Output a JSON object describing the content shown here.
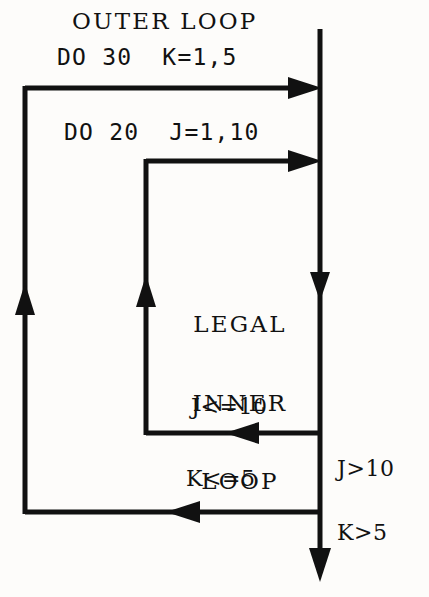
{
  "figure": {
    "kind": "flowchart",
    "background_color": "#fdfcfa",
    "ink_color": "#111111",
    "width": 429,
    "height": 597
  },
  "labels": {
    "outer_loop_caption": "OUTER LOOP",
    "outer_loop_statement": "DO 30  K=1,5",
    "inner_loop_statement": "DO 20  J=1,10",
    "inner_body_line1": "LEGAL",
    "inner_body_line2": "INNER",
    "inner_body_line3": "LOOP",
    "inner_continue_condition": "J<=10",
    "outer_continue_condition": "K<=5",
    "inner_exit_condition": "J>10",
    "outer_exit_condition": "K>5"
  },
  "geometry": {
    "spine_x": 320,
    "spine_top_y": 29,
    "spine_bottom_y": 580,
    "outer_rail_x": 25,
    "outer_rail_top_y": 88,
    "outer_rail_bottom_y": 512,
    "inner_rail_x": 146,
    "inner_rail_top_y": 161,
    "inner_rail_bottom_y": 433,
    "spine_mid_arrow_y": 290,
    "outer_rail_arrow_y": 305,
    "inner_rail_arrow_y": 297,
    "inner_return_arrow_x": 237,
    "outer_return_arrow_x": 178,
    "stroke_width": 5
  },
  "arrows": [
    {
      "name": "outer-loop-entry-arrow",
      "direction": "right",
      "at_x": 320,
      "at_y": 88
    },
    {
      "name": "inner-loop-entry-arrow",
      "direction": "right",
      "at_x": 320,
      "at_y": 161
    },
    {
      "name": "spine-flow-arrow",
      "direction": "down",
      "at_x": 320,
      "at_y": 290
    },
    {
      "name": "inner-rail-return-arrow",
      "direction": "up",
      "at_x": 146,
      "at_y": 297
    },
    {
      "name": "outer-rail-return-arrow",
      "direction": "up",
      "at_x": 25,
      "at_y": 305
    },
    {
      "name": "inner-loop-back-arrow",
      "direction": "left",
      "at_x": 237,
      "at_y": 433
    },
    {
      "name": "outer-loop-back-arrow",
      "direction": "left",
      "at_x": 178,
      "at_y": 512
    },
    {
      "name": "exit-arrow",
      "direction": "down",
      "at_x": 320,
      "at_y": 580
    }
  ]
}
